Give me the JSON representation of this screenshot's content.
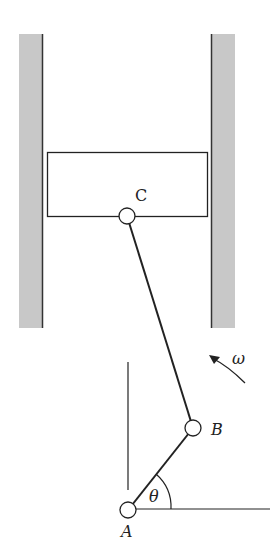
{
  "diagram": {
    "type": "slider-crank mechanism",
    "labels": {
      "C": "C",
      "B": "B",
      "A": "A",
      "theta": "θ",
      "omega": "ω"
    },
    "colors": {
      "wall_fill": "#c8c8c8",
      "wall_edge": "#333333",
      "line": "#222222",
      "joint_fill": "#ffffff"
    },
    "geometry": {
      "left_wall": {
        "x": 19,
        "y": 34,
        "width": 24,
        "height": 294
      },
      "right_wall": {
        "x": 211,
        "y": 34,
        "width": 24,
        "height": 294
      },
      "slider_block": {
        "x": 47,
        "y": 152,
        "width": 161,
        "height": 64
      },
      "joint_C": {
        "x": 127,
        "y": 216,
        "r": 8
      },
      "joint_B": {
        "x": 193,
        "y": 428,
        "r": 8
      },
      "joint_A": {
        "x": 128,
        "y": 535,
        "r": 8
      }
    }
  }
}
